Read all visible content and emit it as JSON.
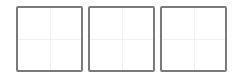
{
  "tiles": [
    {
      "id": "tile-1",
      "state": "empty"
    },
    {
      "id": "tile-2",
      "state": "empty"
    },
    {
      "id": "tile-3",
      "state": "empty"
    }
  ],
  "colors": {
    "border": "#7a7a7a",
    "guide": "#f1f1f1",
    "background": "#ffffff"
  }
}
